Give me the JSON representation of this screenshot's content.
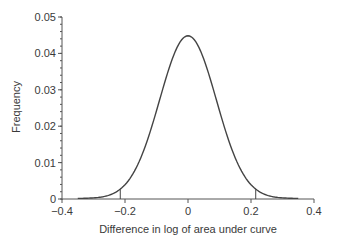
{
  "chart_data": {
    "type": "line",
    "title": "",
    "xlabel": "Difference in log of area under curve",
    "ylabel": "Frequency",
    "xlim": [
      -0.4,
      0.4
    ],
    "ylim": [
      0,
      0.05
    ],
    "x_ticks": [
      -0.4,
      -0.2,
      0,
      0.2,
      0.4
    ],
    "x_tick_labels": [
      "−0.4",
      "−0.2",
      "0",
      "0.2",
      "0.4"
    ],
    "y_ticks": [
      0,
      0.01,
      0.02,
      0.03,
      0.04,
      0.05
    ],
    "y_tick_labels": [
      "0",
      "0.01",
      "0.02",
      "0.03",
      "0.04",
      "0.05"
    ],
    "y_minor_tick_step": 0.002,
    "grid": false,
    "legend": null,
    "series": [
      {
        "name": "Distribution of difference",
        "description": "Approximately normal density centered at 0",
        "mean": 0,
        "sd": 0.09,
        "peak": 0.0447,
        "x_range": [
          -0.35,
          0.35
        ],
        "x": [
          -0.35,
          -0.3,
          -0.25,
          -0.215,
          -0.2,
          -0.15,
          -0.1,
          -0.05,
          0,
          0.05,
          0.1,
          0.15,
          0.2,
          0.215,
          0.25,
          0.3,
          0.35
        ],
        "y": [
          0.0002,
          0.0006,
          0.002,
          0.0026,
          0.0032,
          0.0112,
          0.0242,
          0.0383,
          0.0447,
          0.0383,
          0.0242,
          0.0112,
          0.0032,
          0.0026,
          0.002,
          0.0006,
          0.0002
        ]
      }
    ],
    "annotations": [
      {
        "type": "vline",
        "x": -0.215,
        "y_top": 0.003,
        "description": "lower cutoff marker"
      },
      {
        "type": "vline",
        "x": 0.215,
        "y_top": 0.003,
        "description": "upper cutoff marker"
      }
    ],
    "colors": {
      "curve": "#444444",
      "axis": "#555555",
      "text": "#3a3a3a"
    }
  }
}
